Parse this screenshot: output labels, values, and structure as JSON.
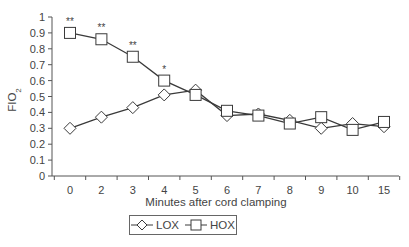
{
  "chart_data": {
    "type": "line",
    "title": "",
    "xlabel": "Minutes after cord clamping",
    "ylabel": "FIO2",
    "ylabel_main": "FIO",
    "ylabel_sub": "2",
    "categories": [
      "0",
      "2",
      "3",
      "4",
      "5",
      "6",
      "7",
      "8",
      "9",
      "10",
      "15"
    ],
    "yticks": [
      "0",
      "0.1",
      "0.2",
      "0.3",
      "0.4",
      "0.5",
      "0.6",
      "0.7",
      "0.8",
      "0.9",
      "1"
    ],
    "ylim": [
      0,
      1
    ],
    "grid": false,
    "legend_position": "bottom-center",
    "series": [
      {
        "name": "LOX",
        "marker": "diamond",
        "values": [
          0.3,
          0.37,
          0.43,
          0.51,
          0.54,
          0.38,
          0.39,
          0.35,
          0.3,
          0.33,
          0.31
        ]
      },
      {
        "name": "HOX",
        "marker": "square",
        "values": [
          0.9,
          0.86,
          0.75,
          0.6,
          0.51,
          0.41,
          0.38,
          0.33,
          0.37,
          0.29,
          0.34
        ]
      }
    ],
    "annotations": [
      {
        "series": "HOX",
        "category": "0",
        "text": "**"
      },
      {
        "series": "HOX",
        "category": "2",
        "text": "**"
      },
      {
        "series": "HOX",
        "category": "3",
        "text": "**"
      },
      {
        "series": "HOX",
        "category": "4",
        "text": "*"
      }
    ]
  },
  "legend": {
    "lox_label": "LOX",
    "hox_label": "HOX"
  },
  "colors": {
    "line": "#3a3a3a",
    "marker_fill": "#ffffff",
    "axis": "#555555"
  }
}
